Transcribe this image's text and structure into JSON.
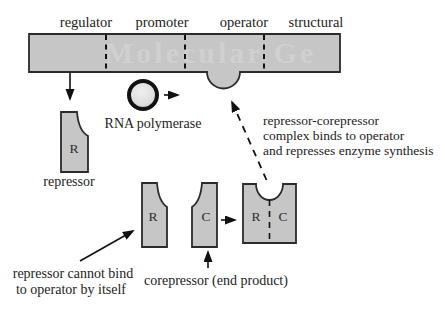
{
  "diagram": {
    "gene_map": {
      "region_labels": [
        "regulator",
        "promoter",
        "operator",
        "structural"
      ],
      "watermark": "Molecular Ge"
    },
    "labels": {
      "rna_polymerase": "RNA polymerase",
      "repressor_caption": "repressor",
      "letter_r": "R",
      "letter_c": "C",
      "corepressor_caption": "corepressor (end product)",
      "cannot_bind_line1": "repressor cannot bind",
      "cannot_bind_line2": "to operator by itself",
      "complex_note_line1": "repressor-corepressor",
      "complex_note_line2": "complex binds to operator",
      "complex_note_line3": "and represses enzyme synthesis"
    },
    "colors": {
      "background": "#ffffff",
      "shape_fill": "#c6c6c6",
      "outline": "#2b2b2b",
      "text": "#1c1c1c",
      "watermark": "#d2d2d2"
    }
  }
}
